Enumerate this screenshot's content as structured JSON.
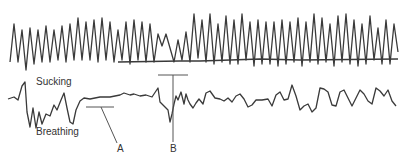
{
  "figure": {
    "traces": [
      {
        "name": "Sucking",
        "description": "upper oscillating trace, regular high-frequency waves with a horizontal baseline starting mid-figure"
      },
      {
        "name": "Breathing",
        "description": "lower irregular waveform, flat segment near A, disruption at B"
      }
    ],
    "labels": {
      "sucking": "Sucking",
      "breathing": "Breathing",
      "marker_a": "A",
      "marker_b": "B"
    },
    "colors": {
      "trace": "#3a3a3a",
      "marker": "#555555",
      "background": "#ffffff"
    }
  }
}
